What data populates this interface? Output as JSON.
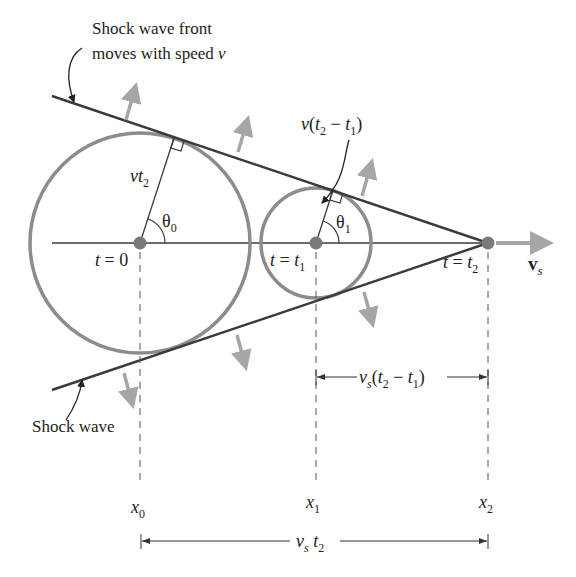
{
  "diagram": {
    "colors": {
      "line": "#3a3a3a",
      "wavefront": "#8c8c8c",
      "arrow": "#a6a6a6",
      "point": "#7a7a7a",
      "text": "#222222"
    },
    "annotations": {
      "front_line1": "Shock wave front",
      "front_line2": "moves with speed ",
      "front_speed": "v",
      "shock_wave": "Shock wave"
    },
    "radii": {
      "big": {
        "v": "v",
        "t": "t",
        "sub": "2"
      },
      "small": {
        "v": "v",
        "open": "(",
        "t2": "t",
        "sub2": "2",
        "minus": " − ",
        "t1": "t",
        "sub1": "1",
        "close": ")"
      }
    },
    "angles": {
      "theta0": {
        "sym": "θ",
        "sub": "0"
      },
      "theta1": {
        "sym": "θ",
        "sub": "1"
      }
    },
    "times": [
      {
        "t": "t",
        "eq": " = 0",
        "sub": ""
      },
      {
        "t": "t",
        "eq": " = ",
        "var": "t",
        "sub": "1"
      },
      {
        "t": "t",
        "eq": " = ",
        "var": "t",
        "sub": "2"
      }
    ],
    "velocity": {
      "symbol": "v",
      "sub": "s"
    },
    "positions": [
      {
        "x": "x",
        "sub": "0"
      },
      {
        "x": "x",
        "sub": "1"
      },
      {
        "x": "x",
        "sub": "2"
      }
    ],
    "dimensions": {
      "partial": {
        "v": "v",
        "vsub": "s",
        "open": "(",
        "t2": "t",
        "sub2": "2",
        "minus": " − ",
        "t1": "t",
        "sub1": "1",
        "close": ")"
      },
      "total": {
        "v": "v",
        "vsub": "s",
        "t": " t",
        "tsub": "2"
      }
    }
  }
}
